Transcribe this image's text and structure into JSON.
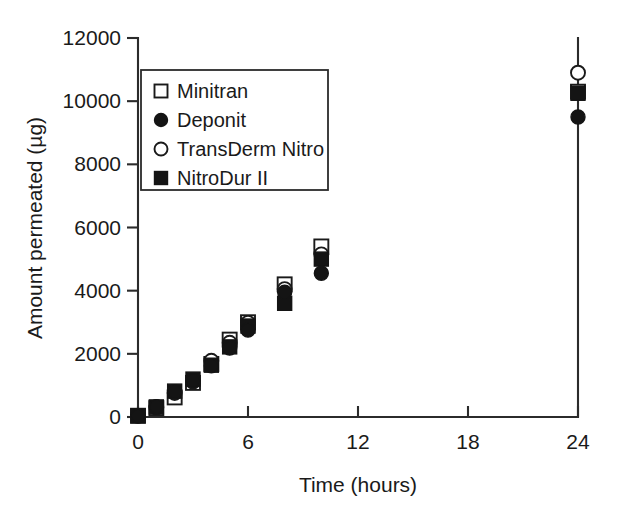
{
  "chart_data": {
    "type": "scatter",
    "title": "",
    "xlabel": "Time (hours)",
    "ylabel": "Amount permeated (µg)",
    "xlim": [
      0,
      24
    ],
    "ylim": [
      0,
      12000
    ],
    "xticks": [
      "0",
      "6",
      "12",
      "18",
      "24"
    ],
    "xtick_values": [
      0,
      6,
      12,
      18,
      24
    ],
    "yticks": [
      "0",
      "2000",
      "4000",
      "6000",
      "8000",
      "10000",
      "12000"
    ],
    "ytick_values": [
      0,
      2000,
      4000,
      6000,
      8000,
      10000,
      12000
    ],
    "grid": false,
    "legend_position": "upper left",
    "x": [
      0,
      1,
      2,
      3,
      4,
      5,
      6,
      8,
      10,
      24
    ],
    "series": [
      {
        "name": "Minitran",
        "marker": "open-square",
        "values": [
          40,
          280,
          620,
          1080,
          1680,
          2450,
          3000,
          4200,
          5400,
          10300
        ]
      },
      {
        "name": "Deponit",
        "marker": "filled-circle",
        "values": [
          30,
          330,
          800,
          1150,
          1620,
          2180,
          2750,
          3950,
          4550,
          9500
        ]
      },
      {
        "name": "TransDerm Nitro",
        "marker": "open-circle",
        "values": [
          45,
          300,
          760,
          1120,
          1780,
          2350,
          2980,
          4050,
          5150,
          10900
        ]
      },
      {
        "name": "NitroDur II",
        "marker": "filled-square",
        "values": [
          35,
          320,
          820,
          1200,
          1640,
          2220,
          2880,
          3600,
          5000,
          10250
        ]
      }
    ]
  },
  "legend": {
    "entries": [
      {
        "label": "Minitran",
        "marker": "open-square"
      },
      {
        "label": "Deponit",
        "marker": "filled-circle"
      },
      {
        "label": "TransDerm Nitro",
        "marker": "open-circle"
      },
      {
        "label": "NitroDur II",
        "marker": "filled-square"
      }
    ]
  },
  "colors": {
    "axis": "#2b2b2b",
    "marker_fill": "#141414",
    "marker_open": "#ffffff",
    "background": "#ffffff"
  }
}
